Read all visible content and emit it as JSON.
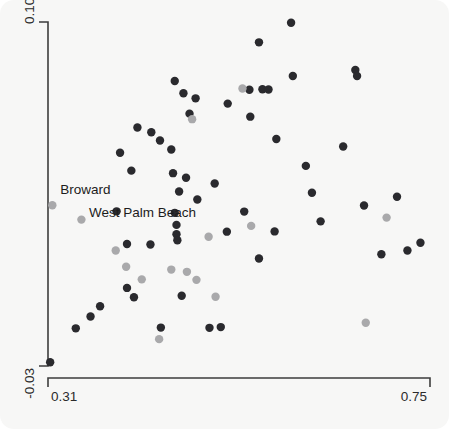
{
  "figure": {
    "background_color": "#f7f7f6",
    "axis_color": "#3d3d3d",
    "dark_point_color": "#2a2a2e",
    "gray_point_color": "#a9a9ab"
  },
  "axes": {
    "x_min_label": "0.31",
    "x_max_label": "0.75",
    "y_min_label": "-0.03",
    "y_max_label": "0.107"
  },
  "annotations": [
    {
      "text": "Broward",
      "x": 0.315,
      "y": 0.04
    },
    {
      "text": "West Palm Beach",
      "x": 0.348,
      "y": 0.031
    }
  ],
  "chart_data": {
    "type": "scatter",
    "title": "",
    "xlabel": "",
    "ylabel": "",
    "xlim": [
      0.31,
      0.75
    ],
    "ylim": [
      -0.03,
      0.107
    ],
    "grid": false,
    "legend": "none",
    "xticks": [
      0.31,
      0.75
    ],
    "yticks": [
      -0.03,
      0.107
    ],
    "series": [
      {
        "name": "dark",
        "color": "#2a2a2e",
        "points": [
          [
            0.3125,
            -0.0285
          ],
          [
            0.342,
            -0.015
          ],
          [
            0.37,
            -0.0062
          ],
          [
            0.359,
            -0.0103
          ],
          [
            0.401,
            0.0011
          ],
          [
            0.409,
            -0.0026
          ],
          [
            0.401,
            0.0186
          ],
          [
            0.428,
            0.0184
          ],
          [
            0.389,
            0.0316
          ],
          [
            0.406,
            0.0478
          ],
          [
            0.393,
            0.0549
          ],
          [
            0.413,
            0.065
          ],
          [
            0.429,
            0.0631
          ],
          [
            0.439,
            0.0598
          ],
          [
            0.456,
            0.0835
          ],
          [
            0.466,
            0.0786
          ],
          [
            0.48,
            0.0766
          ],
          [
            0.473,
            0.0705
          ],
          [
            0.456,
            0.031
          ],
          [
            0.458,
            0.0262
          ],
          [
            0.458,
            0.0225
          ],
          [
            0.459,
            0.0201
          ],
          [
            0.461,
            0.0395
          ],
          [
            0.454,
            0.0468
          ],
          [
            0.452,
            0.0562
          ],
          [
            0.469,
            0.045
          ],
          [
            0.482,
            0.0363
          ],
          [
            0.464,
            -0.002
          ],
          [
            0.502,
            0.0427
          ],
          [
            0.44,
            -0.0147
          ],
          [
            0.496,
            -0.0148
          ],
          [
            0.509,
            -0.0145
          ],
          [
            0.516,
            0.0235
          ],
          [
            0.536,
            0.0315
          ],
          [
            0.517,
            0.0745
          ],
          [
            0.542,
            0.08
          ],
          [
            0.543,
            0.0693
          ],
          [
            0.553,
            0.0989
          ],
          [
            0.557,
            0.0802
          ],
          [
            0.564,
            0.0801
          ],
          [
            0.573,
            0.0604
          ],
          [
            0.553,
            0.0128
          ],
          [
            0.571,
            0.0236
          ],
          [
            0.59,
            0.1067
          ],
          [
            0.592,
            0.0855
          ],
          [
            0.607,
            0.0497
          ],
          [
            0.614,
            0.039
          ],
          [
            0.624,
            0.0276
          ],
          [
            0.65,
            0.0574
          ],
          [
            0.664,
            0.0879
          ],
          [
            0.666,
            0.0855
          ],
          [
            0.674,
            0.0339
          ],
          [
            0.694,
            0.0145
          ],
          [
            0.712,
            0.0374
          ],
          [
            0.724,
            0.016
          ],
          [
            0.739,
            0.0191
          ]
        ]
      },
      {
        "name": "gray",
        "color": "#a9a9ab",
        "points": [
          [
            0.315,
            0.034
          ],
          [
            0.3485,
            0.0283
          ],
          [
            0.388,
            0.016
          ],
          [
            0.4,
            0.0095
          ],
          [
            0.418,
            0.0045
          ],
          [
            0.438,
            -0.0193
          ],
          [
            0.452,
            0.0084
          ],
          [
            0.47,
            0.0075
          ],
          [
            0.481,
            0.0043
          ],
          [
            0.476,
            0.0683
          ],
          [
            0.495,
            0.0215
          ],
          [
            0.503,
            -0.0024
          ],
          [
            0.534,
            0.0805
          ],
          [
            0.544,
            0.0258
          ],
          [
            0.676,
            -0.0128
          ],
          [
            0.7,
            0.0291
          ]
        ]
      }
    ]
  }
}
